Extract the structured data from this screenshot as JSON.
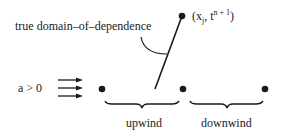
{
  "diagram": {
    "labels": {
      "domain_of_dependence": "true domain–of–dependence",
      "point_open": "(x",
      "point_sub": "j",
      "point_mid": ", t",
      "point_sup": "n + 1",
      "point_close": ")",
      "velocity": "a > 0",
      "upwind": "upwind",
      "downwind": "downwind"
    },
    "nodes": [
      {
        "id": "target",
        "x": 182,
        "y": 16
      },
      {
        "id": "left",
        "x": 102,
        "y": 89
      },
      {
        "id": "center",
        "x": 183,
        "y": 89
      },
      {
        "id": "right",
        "x": 265,
        "y": 89
      }
    ],
    "colors": {
      "ink": "#1a1a1a",
      "background": "#ffffff"
    }
  }
}
